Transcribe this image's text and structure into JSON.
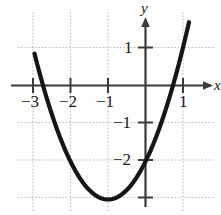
{
  "figure": {
    "background_color": "#fdfdfb",
    "curve_color": "#151515",
    "axis_color": "#3a3a3a",
    "grid_color": "#b9b9b9",
    "width": 221,
    "height": 215
  },
  "axis_labels": {
    "x_axis_name": "x",
    "y_axis_name": "y"
  },
  "x_ticks": [
    {
      "label": "−3",
      "value": -3,
      "px": 33
    },
    {
      "label": "−2",
      "value": -2,
      "px": 70.5
    },
    {
      "label": "−1",
      "value": -1,
      "px": 108
    },
    {
      "label": "1",
      "value": 1,
      "px": 183
    }
  ],
  "y_ticks": [
    {
      "label": "1",
      "value": 1,
      "px": 47.5
    },
    {
      "label": "−1",
      "value": -1,
      "px": 122.5
    },
    {
      "label": "−2",
      "value": -2,
      "px": 160
    }
  ],
  "chart_data": {
    "type": "line",
    "title": "",
    "subtitle": "",
    "xlabel": "x",
    "ylabel": "y",
    "xlim": [
      -3.55,
      1.5
    ],
    "ylim": [
      -3.5,
      1.6
    ],
    "grid": true,
    "grid_step": 1,
    "legend": "none",
    "annotations": [],
    "series": [
      {
        "name": "parabola",
        "equation": "y = x^2 + 2x - 2",
        "vertex": [
          -1,
          -3
        ],
        "roots": [
          -2.73,
          0.73
        ],
        "y_intercept": -2,
        "color": "#151515",
        "line_width": 4,
        "x": [
          -2.95,
          -2.8,
          -2.6,
          -2.4,
          -2.2,
          -2.0,
          -1.8,
          -1.6,
          -1.4,
          -1.2,
          -1.0,
          -0.8,
          -0.6,
          -0.4,
          -0.2,
          0.0,
          0.2,
          0.4,
          0.6,
          0.8,
          1.0,
          1.15
        ],
        "y": [
          0.7,
          -0.76,
          -1.44,
          -2.04,
          -2.56,
          -3.0,
          -2.96,
          -2.84,
          -2.64,
          -2.36,
          -3.0,
          -2.84,
          -2.84,
          -2.64,
          -2.36,
          -2.0,
          -1.56,
          -1.04,
          -0.44,
          0.24,
          1.0,
          1.62
        ]
      }
    ],
    "x_tick_values": [
      -3,
      -2,
      -1,
      1
    ],
    "x_tick_labels": [
      "−3",
      "−2",
      "−1",
      "1"
    ],
    "y_tick_values": [
      1,
      -1,
      -2
    ],
    "y_tick_labels": [
      "1",
      "−1",
      "−2"
    ]
  }
}
